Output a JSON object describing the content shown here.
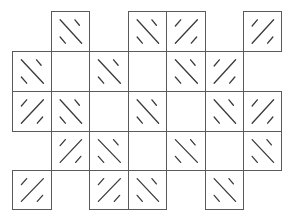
{
  "diagram": {
    "title": "",
    "grid": {
      "cols": 7,
      "rows": 5,
      "col_edges": [
        12,
        51,
        89,
        128,
        166,
        205,
        243,
        281
      ],
      "row_edges": [
        11,
        51,
        91,
        131,
        170,
        209
      ],
      "line_color": "#5a5a5a",
      "stroke_color": "#3a3a3a",
      "background": "#ffffff"
    },
    "cells": [
      {
        "row": 0,
        "col": 1,
        "type": "tile",
        "orientation": "backslash"
      },
      {
        "row": 0,
        "col": 3,
        "type": "tile",
        "orientation": "backslash"
      },
      {
        "row": 0,
        "col": 4,
        "type": "tile",
        "orientation": "slash"
      },
      {
        "row": 0,
        "col": 6,
        "type": "tile",
        "orientation": "slash"
      },
      {
        "row": 1,
        "col": 0,
        "type": "tile",
        "orientation": "backslash"
      },
      {
        "row": 1,
        "col": 1,
        "type": "empty"
      },
      {
        "row": 1,
        "col": 2,
        "type": "tile",
        "orientation": "backslash"
      },
      {
        "row": 1,
        "col": 3,
        "type": "empty"
      },
      {
        "row": 1,
        "col": 4,
        "type": "tile",
        "orientation": "backslash"
      },
      {
        "row": 1,
        "col": 5,
        "type": "tile",
        "orientation": "slash"
      },
      {
        "row": 2,
        "col": 0,
        "type": "tile",
        "orientation": "slash"
      },
      {
        "row": 2,
        "col": 1,
        "type": "tile",
        "orientation": "backslash"
      },
      {
        "row": 2,
        "col": 2,
        "type": "empty"
      },
      {
        "row": 2,
        "col": 3,
        "type": "tile",
        "orientation": "backslash"
      },
      {
        "row": 2,
        "col": 4,
        "type": "empty"
      },
      {
        "row": 2,
        "col": 5,
        "type": "tile",
        "orientation": "backslash"
      },
      {
        "row": 2,
        "col": 6,
        "type": "tile",
        "orientation": "slash"
      },
      {
        "row": 3,
        "col": 1,
        "type": "tile",
        "orientation": "slash"
      },
      {
        "row": 3,
        "col": 2,
        "type": "tile",
        "orientation": "backslash"
      },
      {
        "row": 3,
        "col": 3,
        "type": "empty"
      },
      {
        "row": 3,
        "col": 4,
        "type": "tile",
        "orientation": "backslash"
      },
      {
        "row": 3,
        "col": 5,
        "type": "empty"
      },
      {
        "row": 3,
        "col": 6,
        "type": "tile",
        "orientation": "backslash"
      },
      {
        "row": 4,
        "col": 0,
        "type": "tile",
        "orientation": "slash"
      },
      {
        "row": 4,
        "col": 2,
        "type": "tile",
        "orientation": "slash"
      },
      {
        "row": 4,
        "col": 3,
        "type": "tile",
        "orientation": "backslash"
      },
      {
        "row": 4,
        "col": 5,
        "type": "tile",
        "orientation": "backslash"
      }
    ]
  }
}
